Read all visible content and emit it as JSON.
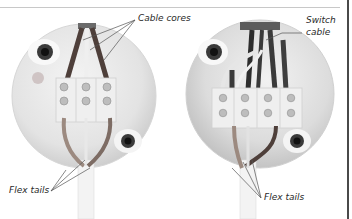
{
  "figure": {
    "left_panel": {
      "labels": {
        "cable_cores": "Cable cores",
        "flex_tails": "Flex tails"
      },
      "terminal_columns": 3,
      "terminal_rows": 2
    },
    "right_panel": {
      "labels": {
        "switch_cable_line1": "Switch",
        "switch_cable_line2": "cable",
        "flex_tails": "Flex tails"
      },
      "terminal_columns": 4,
      "terminal_rows": 2
    },
    "colors": {
      "rose_body": "#e9e9e9",
      "rose_shadow": "#c9c9c9",
      "core_brown": "#5b4a44",
      "core_grey": "#8a8a8a",
      "flex_tan": "#9c8a80",
      "leader_line": "#555555",
      "terminal_block": "#efefef",
      "screw": "#b9b9b9"
    }
  }
}
